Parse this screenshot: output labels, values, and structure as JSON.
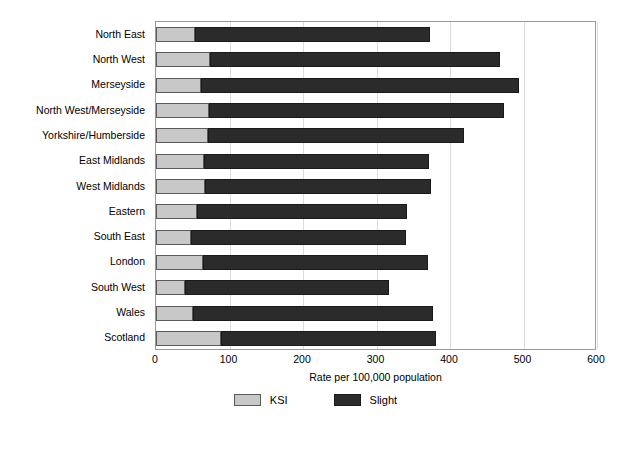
{
  "chart_data": {
    "type": "bar",
    "orientation": "horizontal",
    "stacked": true,
    "title": "",
    "xlabel": "Rate per 100,000 population",
    "ylabel": "",
    "xlim": [
      0,
      600
    ],
    "xticks": [
      0,
      100,
      200,
      300,
      400,
      500,
      600
    ],
    "grid": true,
    "legend_position": "bottom",
    "categories": [
      "North East",
      "North West",
      "Merseyside",
      "North West/Merseyside",
      "Yorkshire/Humberside",
      "East Midlands",
      "West Midlands",
      "Eastern",
      "South East",
      "London",
      "South West",
      "Wales",
      "Scotland"
    ],
    "series": [
      {
        "name": "KSI",
        "color": "#c8c8c8",
        "values": [
          53,
          73,
          61,
          72,
          71,
          65,
          67,
          56,
          48,
          64,
          40,
          50,
          88
        ]
      },
      {
        "name": "Slight",
        "color": "#2b2b2b",
        "values": [
          320,
          395,
          433,
          401,
          348,
          306,
          307,
          286,
          292,
          306,
          277,
          327,
          293
        ]
      }
    ],
    "totals": [
      373,
      468,
      494,
      473,
      419,
      371,
      374,
      342,
      340,
      370,
      317,
      377,
      381
    ]
  },
  "legend": {
    "items": [
      {
        "label": "KSI",
        "swatch": "ksi"
      },
      {
        "label": "Slight",
        "swatch": "slight"
      }
    ]
  }
}
